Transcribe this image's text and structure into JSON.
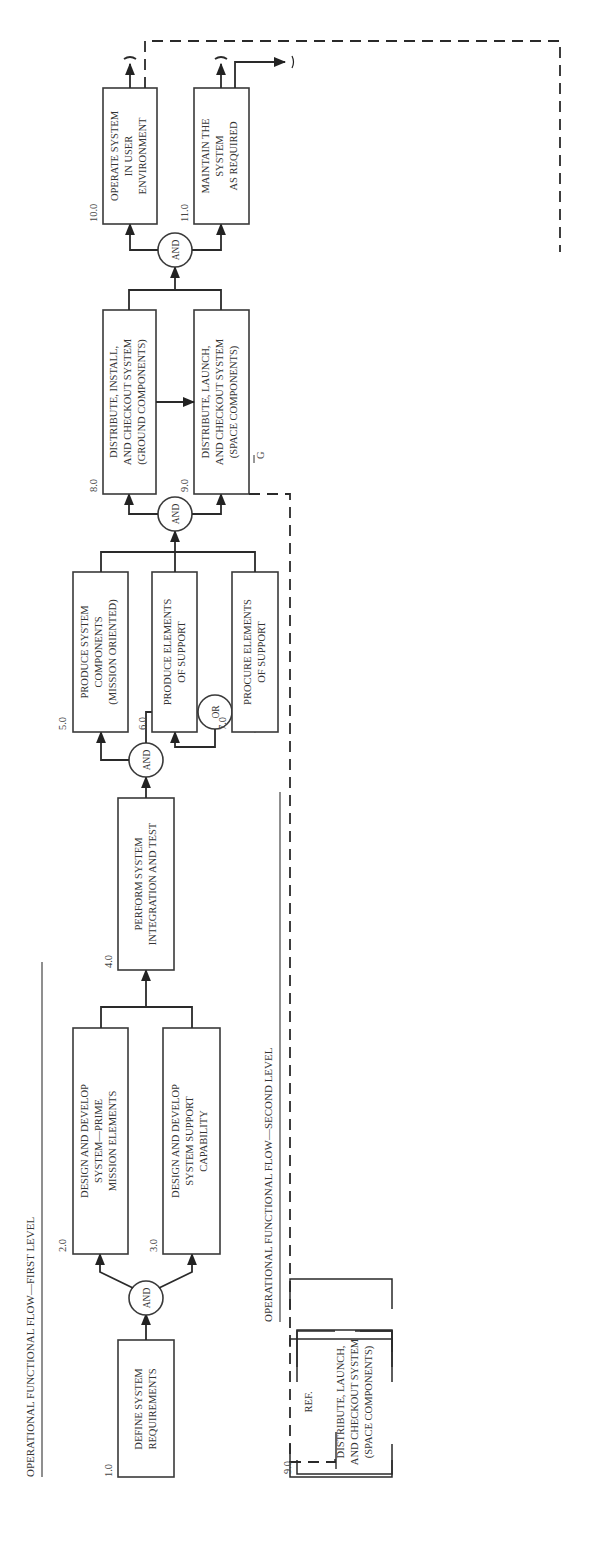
{
  "headers": {
    "first_level": "OPERATIONAL FUNCTIONAL FLOW—FIRST LEVEL",
    "second_level": "OPERATIONAL FUNCTIONAL FLOW—SECOND LEVEL"
  },
  "first_level": {
    "blocks": [
      {
        "id": "1.0",
        "lines": [
          "DEFINE SYSTEM",
          "REQUIREMENTS"
        ]
      },
      {
        "id": "2.0",
        "lines": [
          "DESIGN AND DEVELOP",
          "SYSTEM—PRIME",
          "MISSION ELEMENTS"
        ]
      },
      {
        "id": "3.0",
        "lines": [
          "DESIGN AND DEVELOP",
          "SYSTEM SUPPORT",
          "CAPABILITY"
        ]
      },
      {
        "id": "4.0",
        "lines": [
          "PERFORM SYSTEM",
          "INTEGRATION AND TEST"
        ]
      },
      {
        "id": "5.0",
        "lines": [
          "PRODUCE SYSTEM",
          "COMPONENTS",
          "(MISSION ORIENTED)"
        ]
      },
      {
        "id": "6.0",
        "lines": [
          "PRODUCE ELEMENTS",
          "OF SUPPORT"
        ]
      },
      {
        "id": "7.0",
        "lines": [
          "PROCURE ELEMENTS",
          "OF SUPPORT"
        ]
      },
      {
        "id": "8.0",
        "lines": [
          "DISTRIBUTE, INSTALL,",
          "AND CHECKOUT SYSTEM",
          "(GROUND COMPONENTS)"
        ]
      },
      {
        "id": "9.0",
        "lines": [
          "DISTRIBUTE, LAUNCH,",
          "AND CHECKOUT SYSTEM",
          "(SPACE COMPONENTS)"
        ]
      },
      {
        "id": "10.0",
        "lines": [
          "OPERATE SYSTEM",
          "IN USER",
          "ENVIRONMENT"
        ]
      },
      {
        "id": "11.0",
        "lines": [
          "MAINTAIN THE",
          "SYSTEM",
          "AS REQUIRED"
        ]
      }
    ],
    "gates": [
      "AND",
      "AND",
      "OR",
      "AND",
      "AND"
    ],
    "connector_label": "G"
  },
  "second_level": {
    "ref_start": {
      "id": "9.0",
      "ref": "REF.",
      "lines": [
        "DISTRIBUTE, LAUNCH,",
        "AND CHECKOUT SYSTEM",
        "(SPACE COMPONENTS)"
      ]
    },
    "ref_end": {
      "id": "10.0",
      "ref": "REF.",
      "lines": [
        "OPERATE SYSTEM",
        "IN USER",
        "ENVIRONMENT"
      ]
    },
    "blocks": [
      {
        "id": "9.1",
        "lines": [
          "TRANSPORT SATELLITES",
          "FROM MANUFACTURER TO",
          "LAUNCH SITE"
        ]
      },
      {
        "id": "9.2",
        "lines": [
          "INSTALL SATELLITES",
          "IN SPACE SHUTTLE"
        ]
      },
      {
        "id": "9.3",
        "lines": [
          "PREPARE SPACE SHUTTLE",
          "FOR LAUNCH"
        ]
      },
      {
        "id": "9.4",
        "lines": [
          "PROCESS PAYLOADS FOR",
          "SPACE OPERATIONS"
        ]
      },
      {
        "id": "9.5",
        "lines": [
          "LAUNCH",
          "SPACE",
          "SHUTTLE"
        ]
      },
      {
        "id": "9.6",
        "lines": [
          "TRANSPORT SPACE SHUTTLE",
          "TO LOGISTICS PLATFORM"
        ]
      },
      {
        "id": "9.7",
        "lines": [
          "DOCK SPACE SHUTTLE",
          "AT LOGISTICS PLATFORM",
          "(LOW EARTH ORBIT)"
        ]
      },
      {
        "id": "9.8",
        "lines": [
          "TRANSPORT SATELLITES A AND B",
          "TO ORBIT USING OMV NO.1"
        ]
      },
      {
        "id": "9.9",
        "lines": [
          "TRANSPORT SATELLITES C AND D",
          "TO ORBIT USING OMV NO.2"
        ]
      },
      {
        "id": "9.10",
        "lines": [
          "LAUNCH SATELLITES A AND B"
        ]
      },
      {
        "id": "9.11",
        "lines": [
          "LAUNCH SATELLITES C AND D"
        ]
      }
    ],
    "gates": [
      "AND",
      "AND"
    ]
  }
}
